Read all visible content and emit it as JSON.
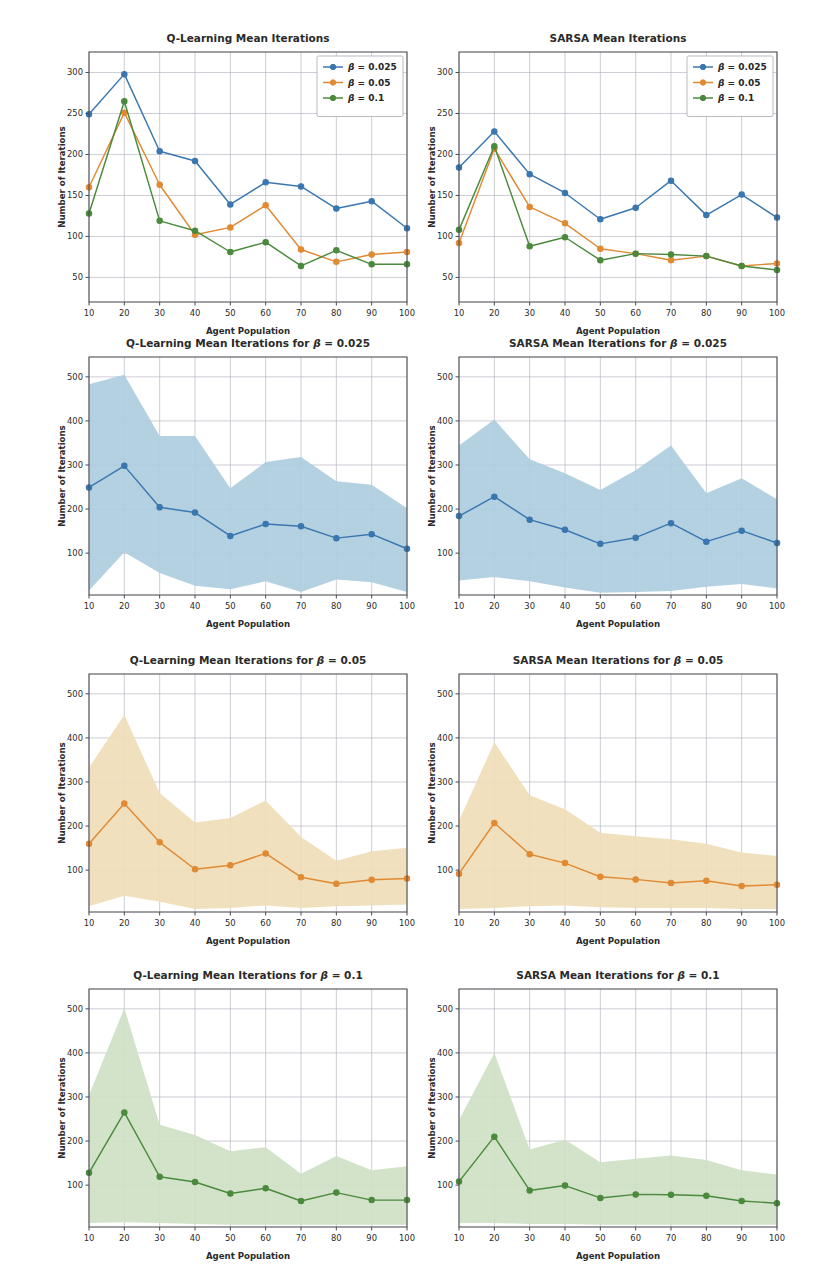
{
  "figure": {
    "width": 822,
    "height": 1282,
    "background": "#ffffff"
  },
  "colors": {
    "beta_0025": "#3a77b0",
    "beta_005": "#e08a33",
    "beta_01": "#4a8a3c",
    "band_0025": "#aecde0",
    "band_005": "#f0ddb8",
    "band_01": "#cfe1c6",
    "grid": "#b8b8c4",
    "spine": "#4a4a52",
    "text": "#262626"
  },
  "labels": {
    "xlabel": "Agent Population",
    "ylabel": "Number of Iterations",
    "legend": [
      "β = 0.025",
      "β = 0.05",
      "β = 0.1"
    ],
    "legend_items": [
      {
        "label_prefix": "β",
        "label_rest": " = 0.025",
        "color_key": "beta_0025"
      },
      {
        "label_prefix": "β",
        "label_rest": " = 0.05",
        "color_key": "beta_005"
      },
      {
        "label_prefix": "β",
        "label_rest": " = 0.1",
        "color_key": "beta_01"
      }
    ]
  },
  "chart_data": [
    {
      "id": "ql-overview",
      "type": "line",
      "title": "Q-Learning Mean Iterations",
      "title_plain": "Q-Learning Mean Iterations",
      "xlabel": "Agent Population",
      "ylabel": "Number of Iterations",
      "x": [
        10,
        20,
        30,
        40,
        50,
        60,
        70,
        80,
        90,
        100
      ],
      "xticks": [
        10,
        20,
        30,
        40,
        50,
        60,
        70,
        80,
        90,
        100
      ],
      "yticks": [
        50,
        100,
        150,
        200,
        250,
        300
      ],
      "xlim": [
        10,
        100
      ],
      "ylim": [
        20,
        325
      ],
      "grid": true,
      "legend_position": "upper right",
      "series": [
        {
          "name": "β = 0.025",
          "color_key": "beta_0025",
          "values": [
            249,
            298,
            204,
            192,
            139,
            166,
            161,
            134,
            143,
            110
          ]
        },
        {
          "name": "β = 0.05",
          "color_key": "beta_005",
          "values": [
            160,
            251,
            163,
            102,
            111,
            138,
            84,
            69,
            78,
            81
          ]
        },
        {
          "name": "β = 0.1",
          "color_key": "beta_01",
          "values": [
            128,
            265,
            119,
            107,
            81,
            93,
            64,
            83,
            66,
            66
          ]
        }
      ]
    },
    {
      "id": "sarsa-overview",
      "type": "line",
      "title": "SARSA Mean Iterations",
      "title_plain": "SARSA Mean Iterations",
      "xlabel": "Agent Population",
      "ylabel": "Number of Iterations",
      "x": [
        10,
        20,
        30,
        40,
        50,
        60,
        70,
        80,
        90,
        100
      ],
      "xticks": [
        10,
        20,
        30,
        40,
        50,
        60,
        70,
        80,
        90,
        100
      ],
      "yticks": [
        50,
        100,
        150,
        200,
        250,
        300
      ],
      "xlim": [
        10,
        100
      ],
      "ylim": [
        20,
        325
      ],
      "grid": true,
      "legend_position": "upper right",
      "series": [
        {
          "name": "β = 0.025",
          "color_key": "beta_0025",
          "values": [
            184,
            228,
            176,
            153,
            121,
            135,
            168,
            126,
            151,
            123
          ]
        },
        {
          "name": "β = 0.05",
          "color_key": "beta_005",
          "values": [
            92,
            207,
            136,
            116,
            85,
            79,
            71,
            76,
            64,
            67
          ]
        },
        {
          "name": "β = 0.1",
          "color_key": "beta_01",
          "values": [
            108,
            210,
            88,
            99,
            71,
            79,
            78,
            76,
            64,
            59
          ]
        }
      ]
    },
    {
      "id": "ql-beta-0025",
      "type": "line",
      "title": "Q-Learning Mean Iterations for β = 0.025",
      "title_plain": "Q-Learning Mean Iterations for ",
      "title_beta": "β",
      "title_tail": " = 0.025",
      "xlabel": "Agent Population",
      "ylabel": "Number of Iterations",
      "x": [
        10,
        20,
        30,
        40,
        50,
        60,
        70,
        80,
        90,
        100
      ],
      "xticks": [
        10,
        20,
        30,
        40,
        50,
        60,
        70,
        80,
        90,
        100
      ],
      "yticks": [
        100,
        200,
        300,
        400,
        500
      ],
      "xlim": [
        10,
        100
      ],
      "ylim": [
        5,
        545
      ],
      "grid": true,
      "band_color_key": "band_0025",
      "series": [
        {
          "name": "β = 0.025",
          "color_key": "beta_0025",
          "values": [
            249,
            298,
            204,
            192,
            139,
            166,
            161,
            134,
            143,
            110
          ],
          "upper": [
            483,
            505,
            366,
            366,
            247,
            307,
            318,
            263,
            255,
            202
          ],
          "lower": [
            15,
            102,
            55,
            26,
            18,
            36,
            12,
            40,
            34,
            12
          ]
        }
      ]
    },
    {
      "id": "sarsa-beta-0025",
      "type": "line",
      "title": "SARSA Mean Iterations for β = 0.025",
      "title_plain": "SARSA Mean Iterations for ",
      "title_beta": "β",
      "title_tail": " = 0.025",
      "xlabel": "Agent Population",
      "ylabel": "Number of Iterations",
      "x": [
        10,
        20,
        30,
        40,
        50,
        60,
        70,
        80,
        90,
        100
      ],
      "xticks": [
        10,
        20,
        30,
        40,
        50,
        60,
        70,
        80,
        90,
        100
      ],
      "yticks": [
        100,
        200,
        300,
        400,
        500
      ],
      "xlim": [
        10,
        100
      ],
      "ylim": [
        5,
        545
      ],
      "grid": true,
      "band_color_key": "band_0025",
      "series": [
        {
          "name": "β = 0.025",
          "color_key": "beta_0025",
          "values": [
            184,
            228,
            176,
            153,
            121,
            135,
            168,
            126,
            151,
            123
          ],
          "upper": [
            344,
            403,
            313,
            281,
            243,
            288,
            344,
            236,
            270,
            222
          ],
          "lower": [
            38,
            46,
            36,
            22,
            10,
            12,
            14,
            24,
            30,
            20
          ]
        }
      ]
    },
    {
      "id": "ql-beta-005",
      "type": "line",
      "title": "Q-Learning Mean Iterations for β = 0.05",
      "title_plain": "Q-Learning Mean Iterations for ",
      "title_beta": "β",
      "title_tail": " = 0.05",
      "xlabel": "Agent Population",
      "ylabel": "Number of Iterations",
      "x": [
        10,
        20,
        30,
        40,
        50,
        60,
        70,
        80,
        90,
        100
      ],
      "xticks": [
        10,
        20,
        30,
        40,
        50,
        60,
        70,
        80,
        90,
        100
      ],
      "yticks": [
        100,
        200,
        300,
        400,
        500
      ],
      "xlim": [
        10,
        100
      ],
      "ylim": [
        5,
        545
      ],
      "grid": true,
      "band_color_key": "band_005",
      "series": [
        {
          "name": "β = 0.05",
          "color_key": "beta_005",
          "values": [
            160,
            251,
            163,
            102,
            111,
            138,
            84,
            69,
            78,
            81
          ],
          "upper": [
            333,
            452,
            275,
            208,
            218,
            258,
            175,
            121,
            143,
            151
          ],
          "lower": [
            18,
            42,
            28,
            12,
            14,
            20,
            14,
            18,
            20,
            22
          ]
        }
      ]
    },
    {
      "id": "sarsa-beta-005",
      "type": "line",
      "title": "SARSA Mean Iterations for β = 0.05",
      "title_plain": "SARSA Mean Iterations for ",
      "title_beta": "β",
      "title_tail": " = 0.05",
      "xlabel": "Agent Population",
      "ylabel": "Number of Iterations",
      "x": [
        10,
        20,
        30,
        40,
        50,
        60,
        70,
        80,
        90,
        100
      ],
      "xticks": [
        10,
        20,
        30,
        40,
        50,
        60,
        70,
        80,
        90,
        100
      ],
      "yticks": [
        100,
        200,
        300,
        400,
        500
      ],
      "xlim": [
        10,
        100
      ],
      "ylim": [
        5,
        545
      ],
      "grid": true,
      "band_color_key": "band_005",
      "series": [
        {
          "name": "β = 0.05",
          "color_key": "beta_005",
          "values": [
            92,
            207,
            136,
            116,
            85,
            79,
            71,
            76,
            64,
            67
          ],
          "upper": [
            212,
            390,
            270,
            238,
            185,
            177,
            170,
            160,
            140,
            132
          ],
          "lower": [
            12,
            14,
            18,
            20,
            16,
            14,
            14,
            14,
            12,
            12
          ]
        }
      ]
    },
    {
      "id": "ql-beta-01",
      "type": "line",
      "title": "Q-Learning Mean Iterations for β = 0.1",
      "title_plain": "Q-Learning Mean Iterations for ",
      "title_beta": "β",
      "title_tail": " = 0.1",
      "xlabel": "Agent Population",
      "ylabel": "Number of Iterations",
      "x": [
        10,
        20,
        30,
        40,
        50,
        60,
        70,
        80,
        90,
        100
      ],
      "xticks": [
        10,
        20,
        30,
        40,
        50,
        60,
        70,
        80,
        90,
        100
      ],
      "yticks": [
        100,
        200,
        300,
        400,
        500
      ],
      "xlim": [
        10,
        100
      ],
      "ylim": [
        5,
        545
      ],
      "grid": true,
      "band_color_key": "band_01",
      "series": [
        {
          "name": "β = 0.1",
          "color_key": "beta_01",
          "values": [
            128,
            265,
            119,
            107,
            81,
            93,
            64,
            83,
            66,
            66
          ],
          "upper": [
            304,
            502,
            237,
            214,
            177,
            186,
            126,
            166,
            134,
            143
          ],
          "lower": [
            14,
            16,
            14,
            12,
            10,
            10,
            10,
            10,
            10,
            10
          ]
        }
      ]
    },
    {
      "id": "sarsa-beta-01",
      "type": "line",
      "title": "SARSA Mean Iterations for β = 0.1",
      "title_plain": "SARSA Mean Iterations for ",
      "title_beta": "β",
      "title_tail": " = 0.1",
      "xlabel": "Agent Population",
      "ylabel": "Number of Iterations",
      "x": [
        10,
        20,
        30,
        40,
        50,
        60,
        70,
        80,
        90,
        100
      ],
      "xticks": [
        10,
        20,
        30,
        40,
        50,
        60,
        70,
        80,
        90,
        100
      ],
      "yticks": [
        100,
        200,
        300,
        400,
        500
      ],
      "xlim": [
        10,
        100
      ],
      "ylim": [
        5,
        545
      ],
      "grid": true,
      "band_color_key": "band_01",
      "series": [
        {
          "name": "β = 0.1",
          "color_key": "beta_01",
          "values": [
            108,
            210,
            88,
            99,
            71,
            79,
            78,
            76,
            64,
            59
          ],
          "upper": [
            248,
            400,
            181,
            203,
            152,
            160,
            167,
            157,
            134,
            124
          ],
          "lower": [
            14,
            14,
            12,
            12,
            10,
            10,
            10,
            10,
            10,
            10
          ]
        }
      ]
    }
  ],
  "panel_layout": [
    {
      "id": "ql-overview",
      "left": 55,
      "top": 28,
      "width": 360,
      "height": 312,
      "legend": true
    },
    {
      "id": "sarsa-overview",
      "left": 425,
      "top": 28,
      "width": 360,
      "height": 312,
      "legend": true
    },
    {
      "id": "ql-beta-0025",
      "left": 55,
      "top": 333,
      "width": 360,
      "height": 300,
      "legend": false
    },
    {
      "id": "sarsa-beta-0025",
      "left": 425,
      "top": 333,
      "width": 360,
      "height": 300,
      "legend": false
    },
    {
      "id": "ql-beta-005",
      "left": 55,
      "top": 650,
      "width": 360,
      "height": 300,
      "legend": false
    },
    {
      "id": "sarsa-beta-005",
      "left": 425,
      "top": 650,
      "width": 360,
      "height": 300,
      "legend": false
    },
    {
      "id": "ql-beta-01",
      "left": 55,
      "top": 965,
      "width": 360,
      "height": 300,
      "legend": false
    },
    {
      "id": "sarsa-beta-01",
      "left": 425,
      "top": 965,
      "width": 360,
      "height": 300,
      "legend": false
    }
  ]
}
